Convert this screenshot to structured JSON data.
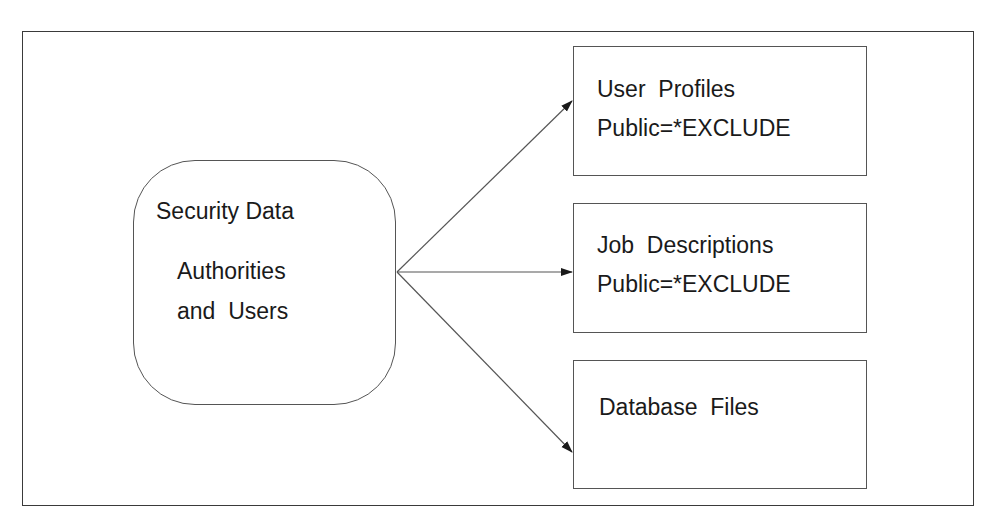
{
  "diagram": {
    "source_node": {
      "title": "Security Data",
      "line1": "Authorities",
      "line2": "and  Users"
    },
    "targets": [
      {
        "title": "User  Profiles",
        "subtitle": "Public=*EXCLUDE"
      },
      {
        "title": "Job  Descriptions",
        "subtitle": "Public=*EXCLUDE"
      },
      {
        "title": "Database  Files",
        "subtitle": ""
      }
    ],
    "edges": [
      {
        "from": "Security Data",
        "to": "User  Profiles"
      },
      {
        "from": "Security Data",
        "to": "Job  Descriptions"
      },
      {
        "from": "Security Data",
        "to": "Database  Files"
      }
    ],
    "colors": {
      "line": "#555555",
      "text": "#1a1a1a",
      "background": "#ffffff"
    }
  }
}
